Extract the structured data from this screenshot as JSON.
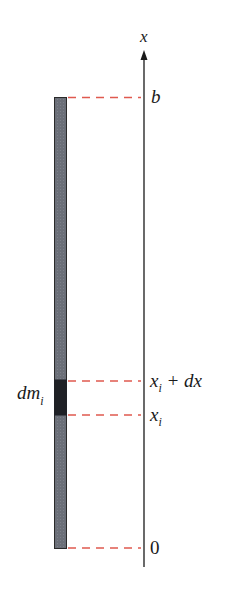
{
  "diagram": {
    "axis": {
      "label": "x",
      "direction": "up"
    },
    "rod": {
      "fill": "#6b6f78",
      "border": "#2a2a2a",
      "element_fill": "#1f2126"
    },
    "guide_lines": {
      "color": "#e05a4f",
      "style": "dashed"
    },
    "labels": {
      "top": "b",
      "element_upper_main": "x",
      "element_upper_sub": "i",
      "element_upper_rest": " + dx",
      "element_lower_main": "x",
      "element_lower_sub": "i",
      "bottom": "0",
      "mass_main": "dm",
      "mass_sub": "i"
    }
  }
}
